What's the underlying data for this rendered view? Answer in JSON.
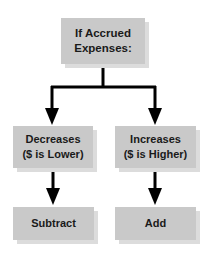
{
  "diagram": {
    "root": {
      "line1": "If Accrued",
      "line2": "Expenses:"
    },
    "branches": [
      {
        "condition_line1": "Decreases",
        "condition_line2": "($ is Lower)",
        "action": "Subtract"
      },
      {
        "condition_line1": "Increases",
        "condition_line2": "($ is Higher)",
        "action": "Add"
      }
    ],
    "colors": {
      "box_fill": "#c9c9c9",
      "box_shadow": "#dcdcdc",
      "arrow": "#000000",
      "text": "#1a1a1a"
    }
  }
}
